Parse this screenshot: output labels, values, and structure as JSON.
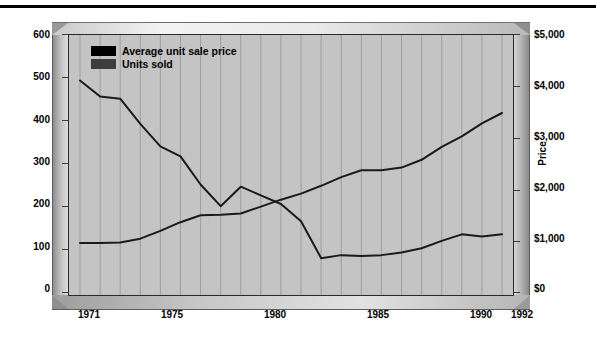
{
  "chart_data": {
    "type": "line",
    "title": "",
    "xlabel": "",
    "ylabel": "Annual Unit Volume (in thousands)",
    "y2label": "Price",
    "grid": true,
    "legend_position": "top-left",
    "xlim": [
      1971,
      1992
    ],
    "ylim": [
      0,
      600
    ],
    "y2lim": [
      0,
      5000
    ],
    "x": [
      1971,
      1972,
      1973,
      1974,
      1975,
      1976,
      1977,
      1978,
      1979,
      1980,
      1981,
      1982,
      1983,
      1984,
      1985,
      1986,
      1987,
      1988,
      1989,
      1990,
      1991,
      1992
    ],
    "xtick_labels": [
      "1971",
      "1975",
      "1980",
      "1985",
      "1990",
      "1992"
    ],
    "xtick_values": [
      1971,
      1975,
      1980,
      1985,
      1990,
      1992
    ],
    "ytick_labels": [
      "0",
      "100",
      "200",
      "300",
      "400",
      "500",
      "600"
    ],
    "ytick_values": [
      0,
      100,
      200,
      300,
      400,
      500,
      600
    ],
    "y2tick_labels": [
      "$0",
      "$1,000",
      "$2,000",
      "$3,000",
      "$4,000",
      "$5,000"
    ],
    "y2tick_values": [
      0,
      1000,
      2000,
      3000,
      4000,
      5000
    ],
    "series": [
      {
        "name": "Average unit sale price",
        "axis": "right",
        "color": "#1a1a1a",
        "swatch_color": "#000000",
        "units": "dollars",
        "values": [
          1000,
          1000,
          1010,
          1080,
          1230,
          1400,
          1530,
          1540,
          1570,
          1700,
          1830,
          1950,
          2100,
          2270,
          2400,
          2400,
          2450,
          2600,
          2850,
          3050,
          3300,
          3500
        ],
        "values_left_scale": [
          120,
          120,
          121,
          130,
          148,
          168,
          184,
          185,
          188,
          204,
          220,
          234,
          252,
          272,
          288,
          288,
          294,
          312,
          342,
          366,
          396,
          420
        ]
      },
      {
        "name": "Units sold",
        "axis": "left",
        "color": "#1a1a1a",
        "swatch_color": "#3d3d3d",
        "units": "thousands",
        "values": [
          495,
          458,
          453,
          395,
          343,
          320,
          255,
          205,
          250,
          230,
          210,
          170,
          85,
          92,
          90,
          92,
          98,
          108,
          125,
          140,
          135,
          140
        ]
      }
    ],
    "annotations": []
  },
  "legend": {
    "items": [
      {
        "label": "Average unit sale price",
        "color": "#000000"
      },
      {
        "label": "Units sold",
        "color": "#3d3d3d"
      }
    ]
  },
  "axes": {
    "left_title": "Annual Unit Volume (in thousands)",
    "right_title": "Price"
  }
}
